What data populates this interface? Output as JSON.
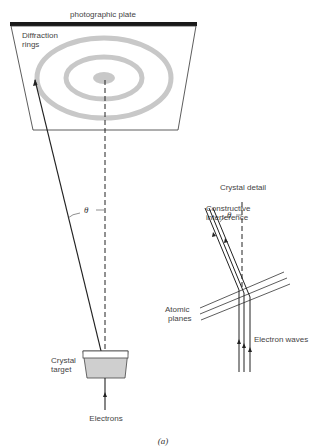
{
  "figure": {
    "plate_label": "photographic plate",
    "rings_label": [
      "Diffraction",
      "rings"
    ],
    "theta_symbol": "θ",
    "crystal_label": [
      "Crystal",
      "target"
    ],
    "electrons_label": "Electrons",
    "detail_title": "Crystal detail",
    "constructive_label": [
      "Constructive",
      "interference"
    ],
    "atomic_planes_label": [
      "Atomic",
      "planes"
    ],
    "electron_waves_label": "Electron waves",
    "caption": "(a)",
    "colors": {
      "ring": "#c8c8c8",
      "line": "#222222",
      "plate": "#1a1a1a",
      "crystal_fill": "#cfcfcf"
    }
  }
}
